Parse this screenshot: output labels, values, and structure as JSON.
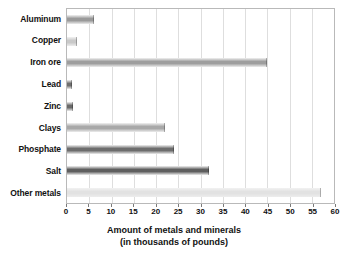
{
  "chart_data": {
    "type": "bar",
    "orientation": "horizontal",
    "title": "",
    "xlabel": "Amount of metals and minerals",
    "xlabel_line2": "(in thousands of pounds)",
    "ylabel": "",
    "xlim": [
      0,
      60
    ],
    "xticks": [
      0,
      5,
      10,
      15,
      20,
      25,
      30,
      35,
      40,
      45,
      50,
      55,
      60
    ],
    "grid": true,
    "legend": "none",
    "categories": [
      "Aluminum",
      "Copper",
      "Iron ore",
      "Lead",
      "Zinc",
      "Clays",
      "Phosphate",
      "Salt",
      "Other metals"
    ],
    "values": [
      6,
      2.2,
      45,
      1.2,
      1.3,
      22,
      24,
      32,
      57
    ],
    "bar_colors": [
      "#9a9a9a",
      "#c9c9c9",
      "#9e9e9e",
      "#6f6f6f",
      "#6a6a6a",
      "#a8a8a8",
      "#6d6d6d",
      "#5f5f5f",
      "#e2e2e2"
    ]
  },
  "axis": {
    "tick_labels": [
      "0",
      "5",
      "10",
      "15",
      "20",
      "25",
      "30",
      "35",
      "40",
      "45",
      "50",
      "55",
      "60"
    ],
    "title_line1": "Amount of metals and minerals",
    "title_line2": "(in thousands of pounds)"
  },
  "style": {
    "plot_border_color": "#b9b9b9",
    "gridline_color": "#dedede",
    "background": "#ffffff",
    "text_color": "#111111"
  }
}
